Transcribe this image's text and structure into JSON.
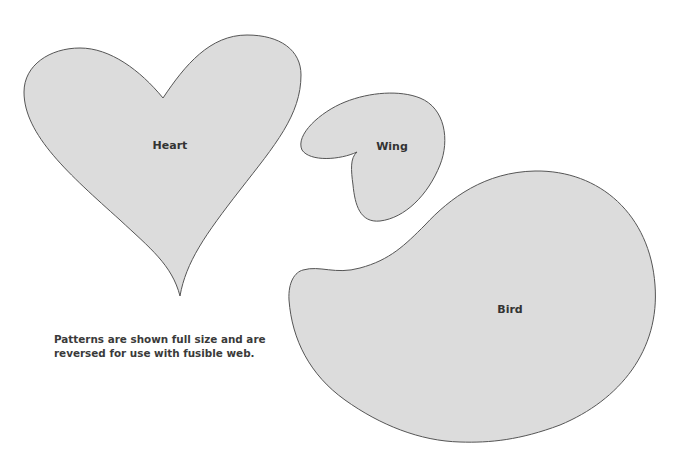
{
  "colors": {
    "background": "#ffffff",
    "shape_fill": "#dcdcdc",
    "shape_stroke": "#555555",
    "text": "#333333"
  },
  "shapes": [
    {
      "id": "heart",
      "label": "Heart",
      "label_pos": [
        170,
        145
      ]
    },
    {
      "id": "wing",
      "label": "Wing",
      "label_pos": [
        392,
        146
      ]
    },
    {
      "id": "bird",
      "label": "Bird",
      "label_pos": [
        510,
        309
      ]
    }
  ],
  "note": {
    "line1": "Patterns are shown full size and are",
    "line2": "reversed for use with fusible web."
  }
}
